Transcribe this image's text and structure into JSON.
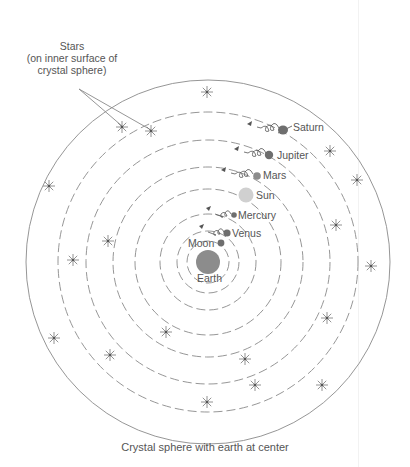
{
  "stars_label": {
    "line1": "Stars",
    "line2": "(on inner surface of",
    "line3": "crystal sphere)"
  },
  "bodies": [
    {
      "name": "Earth",
      "label": "Earth"
    },
    {
      "name": "Moon",
      "label": "Moon"
    },
    {
      "name": "Venus",
      "label": "Venus"
    },
    {
      "name": "Mercury",
      "label": "Mercury"
    },
    {
      "name": "Sun",
      "label": "Sun"
    },
    {
      "name": "Mars",
      "label": "Mars"
    },
    {
      "name": "Jupiter",
      "label": "Jupiter"
    },
    {
      "name": "Saturn",
      "label": "Saturn"
    }
  ],
  "caption": "Crystal sphere with earth at center",
  "colors": {
    "line": "#8a8a8a",
    "earth": "#8c8c8c",
    "planet": "#6e6e6e",
    "sun": "#d0d0d0",
    "text": "#555555"
  }
}
